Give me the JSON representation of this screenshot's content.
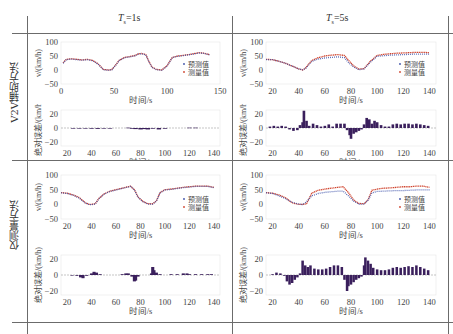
{
  "figure": {
    "column_headers": [
      {
        "symbol": "T",
        "subscript": "s",
        "value": "=1s"
      },
      {
        "symbol": "T",
        "subscript": "s",
        "value": "=5s"
      }
    ],
    "row_labels": [
      "V2V辅助方法",
      "仅测量方法"
    ],
    "legend": {
      "predicted": "预测值",
      "measured": "测量值"
    },
    "velocity_ylabel": "v/(km/h)",
    "error_ylabel": "绝对误差/(km/h)",
    "xlabel": "时间/s",
    "colors": {
      "predicted": "#3b4fa8",
      "measured": "#d0452f",
      "error_bar": "#3a1f5c",
      "frame": "#6b6b6b",
      "grid": "#e6e6e6"
    }
  },
  "chart_data": [
    {
      "id": "v2v_ts1_velocity",
      "type": "scatter",
      "title": "V2V辅助方法, Ts=1s — 速度",
      "xlabel": "时间/s",
      "ylabel": "v/(km/h)",
      "xlim": [
        0,
        150
      ],
      "ylim": [
        -50,
        100
      ],
      "xticks": [
        0,
        50,
        100,
        150
      ],
      "yticks": [
        -50,
        0,
        50,
        100
      ],
      "legend": [
        "预测值",
        "测量值"
      ],
      "legend_position": "lower right",
      "series": [
        {
          "name": "预测值",
          "x": [
            2,
            5,
            10,
            15,
            20,
            25,
            30,
            35,
            38,
            40,
            45,
            48,
            52,
            55,
            60,
            65,
            70,
            73,
            76,
            80,
            83,
            86,
            90,
            95,
            100,
            105,
            110,
            115,
            120,
            125,
            130,
            135,
            140
          ],
          "values": [
            25,
            38,
            40,
            38,
            36,
            38,
            34,
            22,
            10,
            2,
            0,
            2,
            20,
            35,
            45,
            48,
            52,
            58,
            59,
            55,
            30,
            10,
            2,
            0,
            15,
            45,
            50,
            52,
            55,
            58,
            62,
            60,
            55
          ]
        },
        {
          "name": "测量值",
          "x": [
            2,
            5,
            10,
            15,
            20,
            25,
            30,
            35,
            38,
            40,
            45,
            48,
            52,
            55,
            60,
            65,
            70,
            73,
            76,
            80,
            83,
            86,
            90,
            95,
            100,
            105,
            110,
            115,
            120,
            125,
            130,
            135,
            140
          ],
          "values": [
            26,
            38,
            40,
            38,
            36,
            38,
            34,
            22,
            10,
            2,
            0,
            2,
            20,
            35,
            45,
            48,
            52,
            58,
            59,
            55,
            30,
            10,
            2,
            0,
            15,
            45,
            50,
            52,
            55,
            58,
            62,
            60,
            55
          ]
        }
      ]
    },
    {
      "id": "v2v_ts1_error",
      "type": "bar",
      "title": "V2V辅助方法, Ts=1s — 绝对误差",
      "xlabel": "时间/s",
      "ylabel": "绝对误差/(km/h)",
      "xlim": [
        15,
        145
      ],
      "ylim": [
        -25,
        25
      ],
      "xticks": [
        20,
        40,
        60,
        80,
        100,
        120,
        140
      ],
      "yticks": [
        -20,
        0,
        20
      ],
      "x": [
        20,
        25,
        30,
        35,
        40,
        45,
        50,
        55,
        60,
        65,
        70,
        73,
        76,
        80,
        83,
        86,
        90,
        95,
        100,
        105,
        110,
        115,
        120,
        125,
        130,
        135,
        140
      ],
      "values": [
        0,
        -0.5,
        -0.8,
        -0.6,
        -1,
        -1.2,
        -0.8,
        -0.5,
        0,
        0,
        0.5,
        -1,
        -1.5,
        -2,
        -1.5,
        -2,
        -1,
        -2,
        -1,
        0,
        0,
        0,
        0.5,
        0.5,
        0,
        0,
        0
      ]
    },
    {
      "id": "v2v_ts5_velocity",
      "type": "scatter",
      "title": "V2V辅助方法, Ts=5s — 速度",
      "xlabel": "时间/s",
      "ylabel": "v/(km/h)",
      "xlim": [
        15,
        145
      ],
      "ylim": [
        -50,
        100
      ],
      "xticks": [
        20,
        40,
        60,
        80,
        100,
        120,
        140
      ],
      "yticks": [
        -50,
        0,
        50,
        100
      ],
      "legend": [
        "预测值",
        "测量值"
      ],
      "legend_position": "lower right",
      "series": [
        {
          "name": "预测值",
          "x": [
            15,
            20,
            25,
            30,
            35,
            40,
            43,
            45,
            50,
            55,
            60,
            65,
            70,
            75,
            78,
            82,
            86,
            90,
            95,
            100,
            105,
            110,
            115,
            120,
            125,
            130,
            135,
            140
          ],
          "values": [
            38,
            38,
            32,
            25,
            15,
            5,
            2,
            5,
            32,
            40,
            44,
            46,
            48,
            45,
            28,
            12,
            2,
            5,
            30,
            50,
            52,
            54,
            55,
            56,
            57,
            58,
            58,
            58
          ]
        },
        {
          "name": "测量值",
          "x": [
            15,
            20,
            25,
            30,
            35,
            40,
            43,
            45,
            50,
            55,
            60,
            65,
            70,
            75,
            78,
            82,
            86,
            90,
            95,
            100,
            105,
            110,
            115,
            120,
            125,
            130,
            135,
            140
          ],
          "values": [
            38,
            37,
            31,
            24,
            14,
            4,
            0,
            6,
            34,
            44,
            50,
            53,
            55,
            52,
            35,
            15,
            3,
            5,
            32,
            52,
            56,
            58,
            60,
            61,
            62,
            63,
            63,
            62
          ]
        }
      ]
    },
    {
      "id": "v2v_ts5_error",
      "type": "bar",
      "title": "V2V辅助方法, Ts=5s — 绝对误差",
      "xlabel": "时间/s",
      "ylabel": "绝对误差/(km/h)",
      "xlim": [
        15,
        145
      ],
      "ylim": [
        -25,
        25
      ],
      "xticks": [
        20,
        40,
        60,
        80,
        100,
        120,
        140
      ],
      "yticks": [
        -20,
        0,
        20
      ],
      "x": [
        18,
        21,
        24,
        27,
        30,
        33,
        36,
        39,
        41,
        43,
        44,
        46,
        48,
        51,
        54,
        57,
        60,
        63,
        66,
        69,
        72,
        75,
        77,
        79,
        80,
        82,
        84,
        86,
        88,
        90,
        92,
        94,
        96,
        98,
        100,
        103,
        106,
        109,
        112,
        115,
        118,
        121,
        124,
        127,
        130,
        133,
        136,
        139
      ],
      "values": [
        2,
        3,
        2,
        3,
        2,
        -2,
        -4,
        -3,
        4,
        8,
        24,
        10,
        3,
        6,
        4,
        2,
        3,
        5,
        2,
        6,
        6,
        6,
        -3,
        -10,
        -15,
        -8,
        -6,
        -4,
        -2,
        5,
        14,
        12,
        6,
        10,
        8,
        4,
        2,
        2,
        5,
        6,
        5,
        6,
        6,
        5,
        6,
        5,
        4,
        3
      ]
    },
    {
      "id": "meas_ts1_velocity",
      "type": "scatter",
      "title": "仅测量方法, Ts=1s — 速度",
      "xlabel": "时间/s",
      "ylabel": "v/(km/h)",
      "xlim": [
        15,
        145
      ],
      "ylim": [
        -50,
        100
      ],
      "xticks": [
        20,
        40,
        60,
        80,
        100,
        120,
        140
      ],
      "yticks": [
        -50,
        0,
        50,
        100
      ],
      "legend": [
        "预测值",
        "测量值"
      ],
      "legend_position": "lower right",
      "series": [
        {
          "name": "预测值",
          "x": [
            15,
            20,
            25,
            30,
            35,
            38,
            40,
            43,
            46,
            50,
            55,
            60,
            65,
            70,
            72,
            75,
            78,
            82,
            86,
            90,
            93,
            96,
            100,
            105,
            110,
            115,
            120,
            125,
            130,
            135,
            140
          ],
          "values": [
            40,
            38,
            32,
            22,
            5,
            0,
            0,
            2,
            20,
            35,
            45,
            50,
            55,
            60,
            62,
            50,
            25,
            10,
            2,
            2,
            12,
            40,
            50,
            52,
            55,
            58,
            60,
            62,
            62,
            62,
            58
          ]
        },
        {
          "name": "测量值",
          "x": [
            15,
            20,
            25,
            30,
            35,
            38,
            40,
            43,
            46,
            50,
            55,
            60,
            65,
            70,
            72,
            75,
            78,
            82,
            86,
            90,
            93,
            96,
            100,
            105,
            110,
            115,
            120,
            125,
            130,
            135,
            140
          ],
          "values": [
            40,
            38,
            32,
            23,
            5,
            0,
            0,
            2,
            20,
            35,
            45,
            50,
            55,
            60,
            62,
            50,
            25,
            10,
            2,
            2,
            12,
            40,
            50,
            52,
            55,
            58,
            60,
            62,
            62,
            62,
            58
          ]
        }
      ]
    },
    {
      "id": "meas_ts1_error",
      "type": "bar",
      "title": "仅测量方法, Ts=1s — 绝对误差",
      "xlabel": "时间/s",
      "ylabel": "绝对误差/(km/h)",
      "xlim": [
        15,
        145
      ],
      "ylim": [
        -25,
        25
      ],
      "xticks": [
        20,
        40,
        60,
        80,
        100,
        120,
        140
      ],
      "yticks": [
        -20,
        0,
        20
      ],
      "x": [
        20,
        24,
        28,
        31,
        33,
        36,
        40,
        42,
        44,
        47,
        50,
        55,
        60,
        65,
        68,
        70,
        73,
        75,
        76,
        78,
        80,
        83,
        86,
        89,
        90,
        91,
        93,
        96,
        100,
        105,
        110,
        115,
        118,
        120,
        125,
        130,
        135,
        138
      ],
      "values": [
        0,
        -0.5,
        -1,
        -3,
        -4,
        -1,
        2,
        4,
        3,
        1,
        0,
        0,
        0,
        1,
        2,
        2,
        -2,
        -8,
        -7,
        -2,
        0,
        0,
        0,
        2,
        10,
        6,
        3,
        1,
        0,
        1,
        1,
        2,
        2,
        1,
        1,
        1,
        1,
        1
      ]
    },
    {
      "id": "meas_ts5_velocity",
      "type": "scatter",
      "title": "仅测量方法, Ts=5s — 速度",
      "xlabel": "时间/s",
      "ylabel": "v/(km/h)",
      "xlim": [
        15,
        145
      ],
      "ylim": [
        -50,
        100
      ],
      "xticks": [
        20,
        40,
        60,
        80,
        100,
        120,
        140
      ],
      "yticks": [
        -50,
        0,
        50,
        100
      ],
      "legend": [
        "预测值",
        "测量值"
      ],
      "legend_position": "lower right",
      "series": [
        {
          "name": "预测值",
          "x": [
            15,
            20,
            25,
            30,
            35,
            40,
            43,
            46,
            50,
            55,
            60,
            65,
            70,
            74,
            78,
            82,
            86,
            90,
            93,
            96,
            100,
            105,
            110,
            115,
            120,
            125,
            130,
            135,
            140
          ],
          "values": [
            40,
            38,
            30,
            20,
            8,
            2,
            0,
            10,
            30,
            38,
            42,
            44,
            46,
            46,
            30,
            12,
            2,
            2,
            15,
            40,
            45,
            46,
            47,
            48,
            48,
            49,
            50,
            50,
            50
          ]
        },
        {
          "name": "测量值",
          "x": [
            15,
            20,
            25,
            30,
            35,
            40,
            43,
            46,
            50,
            55,
            60,
            65,
            70,
            74,
            78,
            82,
            86,
            90,
            93,
            96,
            100,
            105,
            110,
            115,
            120,
            125,
            130,
            135,
            140
          ],
          "values": [
            40,
            38,
            32,
            22,
            5,
            0,
            0,
            2,
            38,
            48,
            52,
            55,
            58,
            60,
            40,
            15,
            3,
            2,
            15,
            48,
            52,
            55,
            56,
            58,
            60,
            60,
            62,
            62,
            58
          ]
        }
      ]
    },
    {
      "id": "meas_ts5_error",
      "type": "bar",
      "title": "仅测量方法, Ts=5s — 绝对误差",
      "xlabel": "时间/s",
      "ylabel": "绝对误差/(km/h)",
      "xlim": [
        15,
        145
      ],
      "ylim": [
        -25,
        25
      ],
      "xticks": [
        20,
        40,
        60,
        80,
        100,
        120,
        140
      ],
      "yticks": [
        -20,
        0,
        20
      ],
      "x": [
        17,
        20,
        23,
        26,
        29,
        31,
        33,
        35,
        37,
        39,
        41,
        43,
        45,
        47,
        49,
        52,
        55,
        58,
        61,
        64,
        67,
        70,
        73,
        75,
        77,
        78,
        80,
        82,
        84,
        86,
        88,
        90,
        91,
        93,
        95,
        97,
        100,
        103,
        106,
        109,
        112,
        115,
        118,
        121,
        124,
        127,
        130,
        133,
        136,
        139
      ],
      "values": [
        0,
        1,
        3,
        2,
        -1,
        -8,
        -12,
        -10,
        -6,
        -3,
        2,
        18,
        12,
        10,
        12,
        8,
        7,
        7,
        8,
        10,
        12,
        12,
        10,
        -6,
        -20,
        -14,
        -12,
        -9,
        -6,
        -4,
        -2,
        12,
        22,
        18,
        14,
        9,
        7,
        6,
        6,
        7,
        9,
        10,
        9,
        10,
        11,
        10,
        12,
        10,
        8,
        6
      ]
    }
  ]
}
